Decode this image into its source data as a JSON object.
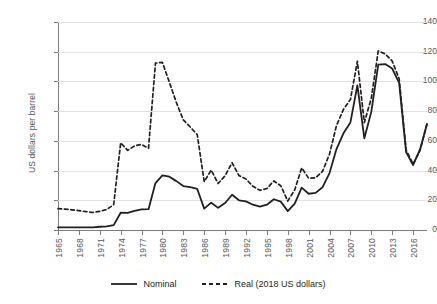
{
  "chart_data": {
    "type": "line",
    "title": "",
    "subtitle": "",
    "xlabel": "",
    "ylabel": "US dollars per barrel",
    "ylim": [
      0,
      140
    ],
    "ytick_values": [
      0,
      20,
      40,
      60,
      80,
      100,
      120,
      140
    ],
    "ytick_labels": [
      "0",
      "20",
      "40",
      "60",
      "80",
      "100",
      "120",
      "140"
    ],
    "xlim": [
      1965,
      2018
    ],
    "xtick_values": [
      1965,
      1968,
      1971,
      1974,
      1977,
      1980,
      1983,
      1986,
      1989,
      1992,
      1995,
      1998,
      2001,
      2004,
      2007,
      2010,
      2013,
      2016
    ],
    "xtick_labels": [
      "1965",
      "1968",
      "1971",
      "1974",
      "1977",
      "1980",
      "1983",
      "1986",
      "1989",
      "1992",
      "1995",
      "1998",
      "2001",
      "2004",
      "2007",
      "2010",
      "2013",
      "2016"
    ],
    "grid": "horizontal",
    "legend_position": "bottom",
    "x": [
      1965,
      1966,
      1967,
      1968,
      1969,
      1970,
      1971,
      1972,
      1973,
      1974,
      1975,
      1976,
      1977,
      1978,
      1979,
      1980,
      1981,
      1982,
      1983,
      1984,
      1985,
      1986,
      1987,
      1988,
      1989,
      1990,
      1991,
      1992,
      1993,
      1994,
      1995,
      1996,
      1997,
      1998,
      1999,
      2000,
      2001,
      2002,
      2003,
      2004,
      2005,
      2006,
      2007,
      2008,
      2009,
      2010,
      2011,
      2012,
      2013,
      2014,
      2015,
      2016,
      2017,
      2018
    ],
    "series": [
      {
        "name": "Nominal",
        "style": "solid",
        "color": "#231f20",
        "values": [
          1.8,
          1.8,
          1.8,
          1.8,
          1.8,
          1.8,
          2.2,
          2.5,
          3.3,
          11.6,
          11.5,
          12.8,
          13.9,
          14.0,
          31.6,
          36.8,
          35.9,
          32.9,
          29.6,
          28.8,
          27.6,
          14.4,
          18.4,
          14.9,
          18.2,
          23.7,
          20.0,
          19.3,
          17.0,
          15.8,
          17.0,
          20.7,
          19.1,
          12.7,
          17.8,
          28.5,
          24.4,
          25.0,
          28.8,
          38.3,
          54.5,
          65.1,
          72.4,
          97.3,
          61.7,
          79.5,
          111.3,
          111.7,
          108.7,
          99.0,
          52.4,
          43.7,
          54.2,
          71.3
        ]
      },
      {
        "name": "Real (2018 US dollars)",
        "style": "dashed",
        "color": "#231f20",
        "values": [
          14.4,
          14.0,
          13.6,
          13.0,
          12.4,
          11.8,
          12.6,
          13.8,
          17.1,
          58.7,
          53.6,
          56.6,
          57.6,
          55.0,
          112.3,
          112.8,
          99.4,
          85.8,
          74.1,
          69.3,
          64.2,
          32.5,
          40.3,
          31.3,
          36.5,
          45.3,
          36.6,
          34.3,
          29.4,
          26.7,
          27.9,
          33.0,
          29.8,
          19.5,
          27.0,
          41.8,
          34.8,
          35.1,
          39.5,
          51.1,
          70.3,
          81.2,
          87.8,
          113.6,
          72.3,
          88.7,
          120.5,
          118.5,
          113.7,
          101.8,
          53.9,
          44.3,
          53.6,
          71.3
        ]
      }
    ]
  },
  "legend": {
    "items": [
      {
        "label": "Nominal",
        "style": "solid"
      },
      {
        "label": "Real (2018 US dollars)",
        "style": "dashed"
      }
    ]
  }
}
